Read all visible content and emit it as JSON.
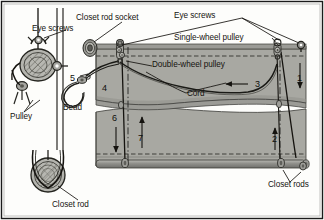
{
  "figure": {
    "background_color": "#fdfdfb",
    "border_color": "#1b1b1b",
    "fabric_color": "#a8a8a2",
    "fabric_shadow_color": "#949490",
    "line_color": "#15130f",
    "hardware_color": "#8e8e8a"
  },
  "labels": {
    "closet_rod_socket": "Closet rod socket",
    "eye_screws_left": "Eye screws",
    "eye_screws_right": "Eye screws",
    "single_wheel_pulley": "Single-wheel pulley",
    "double_wheel_pulley": "Double-wheel pulley",
    "cord": "Cord",
    "bead": "Bead",
    "pulley": "Pulley",
    "closet_rod": "Closet rod",
    "closet_rods": "Closet rods"
  },
  "callouts": [
    {
      "id": "1",
      "number": "1",
      "direction": "down",
      "x": 299,
      "y": 78
    },
    {
      "id": "2",
      "number": "2",
      "direction": "up",
      "x": 275,
      "y": 139
    },
    {
      "id": "3",
      "number": "3",
      "direction": "left",
      "x": 256,
      "y": 85
    },
    {
      "id": "4",
      "number": "4",
      "direction": "none",
      "x": 104,
      "y": 88
    },
    {
      "id": "5",
      "number": "5",
      "direction": "none",
      "x": 72,
      "y": 78
    },
    {
      "id": "6",
      "number": "6",
      "direction": "down",
      "x": 115,
      "y": 119
    },
    {
      "id": "7",
      "number": "7",
      "direction": "up",
      "x": 141,
      "y": 137
    }
  ],
  "panels": {
    "upper_fabric_label": "upper shade panel",
    "lower_fabric_label": "lower shade panel"
  },
  "detail_view": {
    "name": "left cutaway pulley detail",
    "items": [
      "eye-screw",
      "double-wheel pulley",
      "cord",
      "closet rod end"
    ]
  }
}
